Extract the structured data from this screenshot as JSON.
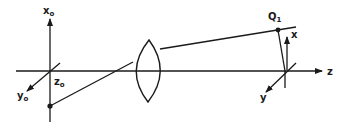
{
  "diagram": {
    "colors": {
      "ink": "#1a1a1a",
      "background": "#ffffff"
    },
    "object_frame": {
      "x_axis_label": "x",
      "x_axis_sub": "o",
      "y_axis_label": "y",
      "y_axis_sub": "o",
      "z_axis_label": "z",
      "z_axis_sub": "o"
    },
    "image_frame": {
      "x_axis_label": "x",
      "y_axis_label": "y",
      "z_axis_label": "z"
    },
    "image_point": {
      "label": "Q",
      "sub": "1"
    },
    "elements": [
      "optical-axis",
      "lens",
      "object-point",
      "ray-object-to-lens",
      "ray-lens-to-image",
      "image-point"
    ]
  }
}
